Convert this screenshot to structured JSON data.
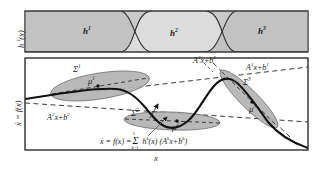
{
  "figure": {
    "kind": "two-panel scientific diagram",
    "background_color": "#ffffff",
    "frame_color": "#3a3a3a",
    "panel_fill_top": "#c9c9c9",
    "curve_color": "#1a1a1a",
    "ellipse_fill": "#b4b4b4",
    "dashed_color": "#333333"
  },
  "top_panel": {
    "name": "membership-functions-panel",
    "ylabel": "h",
    "ylabel_sup": "i",
    "ylabel_arg": "(x)",
    "ylabel_full": "h i (x)",
    "regions": [
      {
        "id": "h1",
        "base": "h",
        "sup": "1",
        "label": "h¹",
        "center_x_frac": 0.21,
        "fill": "#c2c2c2"
      },
      {
        "id": "h2",
        "base": "h",
        "sup": "2",
        "label": "h²",
        "center_x_frac": 0.52,
        "fill": "#d8d8d8"
      },
      {
        "id": "h3",
        "base": "h",
        "sup": "3",
        "label": "h³",
        "center_x_frac": 0.83,
        "fill": "#c2c2c2"
      }
    ]
  },
  "bottom_panel": {
    "name": "state-derivative-panel",
    "ylabel_base": "x",
    "ylabel_full": "ẋ = f(x)",
    "xlabel": "x",
    "clusters": [
      {
        "id": "sigma1",
        "sigma_label": "Σ",
        "sigma_sup": "1",
        "mu_label": "μ",
        "mu_sup": "1"
      },
      {
        "id": "sigma2",
        "sigma_label": "Σ",
        "sigma_sup": "2",
        "mu_label": "μ",
        "mu_sup": "2"
      },
      {
        "id": "sigma3",
        "sigma_label": "Σ",
        "sigma_sup": "3",
        "mu_label": "μ",
        "mu_sup": "3"
      }
    ],
    "affine_models": [
      {
        "id": "model1",
        "label": "A¹x+b¹",
        "A": "A",
        "sup": "1",
        "x": "x+",
        "b": "b"
      },
      {
        "id": "model2",
        "label": "A²x+b²",
        "A": "A",
        "sup": "2",
        "x": "x+",
        "b": "b"
      },
      {
        "id": "model3",
        "label": "A³x+b³",
        "A": "A",
        "sup": "3",
        "x": "x+",
        "b": "b"
      }
    ],
    "equation": {
      "lhs": "ẋ = f(x) =",
      "sum": "Σ",
      "sum_lower": "k=1",
      "sum_upper": "3",
      "term_h": "h",
      "term_h_sup": "k",
      "term_h_arg": "(x)",
      "term_affine": "(A",
      "term_affine_sup": "k",
      "term_affine_mid": "x+b",
      "term_affine_sup2": "k",
      "term_affine_close": ")",
      "full": "ẋ = f(x) = Σ(k=1..3) h^k(x) (A^k x + b^k)"
    }
  }
}
